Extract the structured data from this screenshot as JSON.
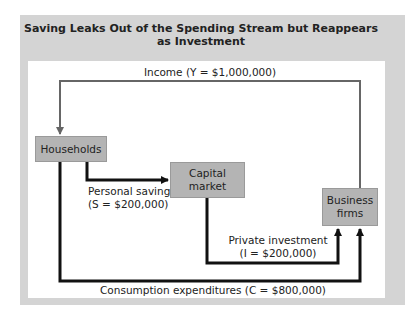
{
  "figure": {
    "title_line1": "Saving Leaks Out of the Spending Stream but Reappears",
    "title_line2": "as Investment"
  },
  "nodes": {
    "households": "Households",
    "capital_market_line1": "Capital",
    "capital_market_line2": "market",
    "business_line1": "Business",
    "business_line2": "firms"
  },
  "flows": {
    "income": "Income (Y = $1,000,000)",
    "saving_line1": "Personal saving",
    "saving_line2": "(S = $200,000)",
    "investment_line1": "Private investment",
    "investment_line2": "(I = $200,000)",
    "consumption": "Consumption expenditures (C = $800,000)"
  },
  "colors": {
    "panel": "#d4d4d4",
    "box": "#b4b4b4",
    "income_line": "#666666",
    "flow_line": "#111111"
  }
}
